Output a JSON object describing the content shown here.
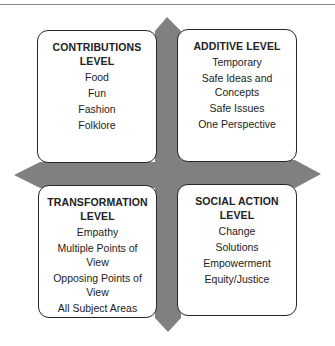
{
  "colors": {
    "cross_fill": "#808080",
    "box_border": "#262626",
    "box_fill": "#ffffff",
    "text": "#222222",
    "top_rule": "#8a8a8a"
  },
  "quadrants": {
    "top_left": {
      "title": "CONTRIBUTIONS LEVEL",
      "items": [
        "Food",
        "Fun",
        "Fashion",
        "Folklore"
      ]
    },
    "top_right": {
      "title": "ADDITIVE LEVEL",
      "items": [
        "Temporary",
        "Safe Ideas and Concepts",
        "Safe Issues",
        "One Perspective"
      ]
    },
    "bottom_left": {
      "title": "TRANSFORMATION LEVEL",
      "items": [
        "Empathy",
        "Multiple Points of View",
        "Opposing Points of View",
        "All Subject Areas"
      ]
    },
    "bottom_right": {
      "title": "SOCIAL ACTION LEVEL",
      "items": [
        "Change",
        "Solutions",
        "Empowerment",
        "Equity/Justice"
      ]
    }
  }
}
